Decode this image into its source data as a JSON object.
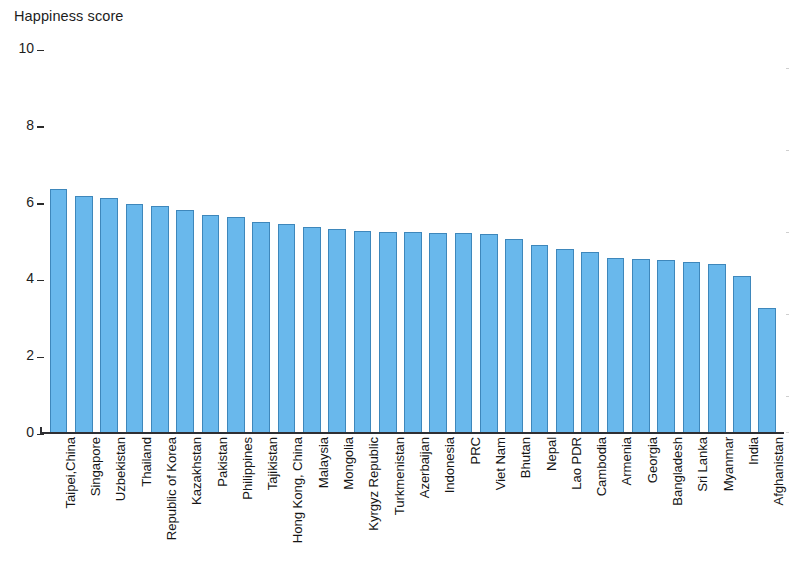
{
  "chart_data": {
    "type": "bar",
    "title": "Happiness score",
    "xlabel": "",
    "ylabel": "Happiness score",
    "ylim": [
      0,
      10
    ],
    "yticks": [
      0,
      2,
      4,
      6,
      8,
      10
    ],
    "grid": false,
    "legend": null,
    "bar_color": "#69b8ec",
    "bar_edge_color": "#3e87bb",
    "axis_color": "#2f2f33",
    "categories": [
      "Taipei,China",
      "Singapore",
      "Uzbekistan",
      "Thailand",
      "Republic of Korea",
      "Kazakhstan",
      "Pakistan",
      "Philippines",
      "Tajikistan",
      "Hong Kong, China",
      "Malaysia",
      "Mongolia",
      "Kyrgyz Republic",
      "Turkmenistan",
      "Azerbaijan",
      "Indonesia",
      "PRC",
      "Viet Nam",
      "Bhutan",
      "Nepal",
      "Lao PDR",
      "Cambodia",
      "Armenia",
      "Georgia",
      "Bangladesh",
      "Sri Lanka",
      "Myanmar",
      "India",
      "Afghanistan"
    ],
    "values": [
      6.35,
      6.15,
      6.1,
      5.95,
      5.9,
      5.8,
      5.65,
      5.6,
      5.48,
      5.43,
      5.34,
      5.29,
      5.26,
      5.23,
      5.21,
      5.2,
      5.19,
      5.17,
      5.05,
      4.88,
      4.78,
      4.7,
      4.55,
      4.52,
      4.5,
      4.44,
      4.38,
      4.07,
      3.25
    ]
  },
  "yaxis": {
    "ticks": [
      "10",
      "8",
      "6",
      "4",
      "2",
      "0"
    ]
  }
}
